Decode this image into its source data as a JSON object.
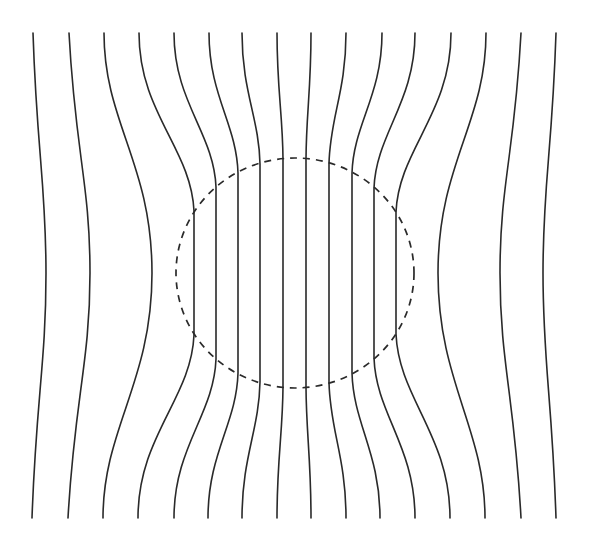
{
  "diagram": {
    "colors": {
      "background": "#ffffff",
      "line": "#2a2a2a"
    },
    "frame": {
      "top_y": 33,
      "bottom_y": 518
    },
    "boundary": {
      "shape": "circle",
      "style": "dashed",
      "cx": 295,
      "cy": 273,
      "rx": 119,
      "ry": 115
    },
    "line_count": 16,
    "lines": [
      {
        "id": 1,
        "top_x": 33,
        "bottom_x": 32,
        "mid_x": 46,
        "type": "outside"
      },
      {
        "id": 2,
        "top_x": 69,
        "bottom_x": 68,
        "mid_x": 90,
        "type": "outside"
      },
      {
        "id": 3,
        "top_x": 104,
        "bottom_x": 103,
        "mid_x": 152,
        "type": "outside"
      },
      {
        "id": 4,
        "top_x": 139,
        "bottom_x": 138,
        "inside_x": 194,
        "entry_y": 211,
        "exit_y": 335,
        "type": "inside"
      },
      {
        "id": 5,
        "top_x": 174,
        "bottom_x": 174,
        "inside_x": 216,
        "entry_y": 187,
        "exit_y": 359,
        "type": "inside"
      },
      {
        "id": 6,
        "top_x": 209,
        "bottom_x": 208,
        "inside_x": 238,
        "entry_y": 173,
        "exit_y": 373,
        "type": "inside"
      },
      {
        "id": 7,
        "top_x": 242,
        "bottom_x": 242,
        "inside_x": 260,
        "entry_y": 164,
        "exit_y": 382,
        "type": "inside"
      },
      {
        "id": 8,
        "top_x": 277,
        "bottom_x": 277,
        "inside_x": 283,
        "entry_y": 159,
        "exit_y": 387,
        "type": "inside"
      },
      {
        "id": 9,
        "top_x": 311,
        "bottom_x": 311,
        "inside_x": 306,
        "entry_y": 159,
        "exit_y": 387,
        "type": "inside"
      },
      {
        "id": 10,
        "top_x": 346,
        "bottom_x": 346,
        "inside_x": 329,
        "entry_y": 164,
        "exit_y": 382,
        "type": "inside"
      },
      {
        "id": 11,
        "top_x": 382,
        "bottom_x": 380,
        "inside_x": 352,
        "entry_y": 173,
        "exit_y": 373,
        "type": "inside"
      },
      {
        "id": 12,
        "top_x": 415,
        "bottom_x": 415,
        "inside_x": 374,
        "entry_y": 188,
        "exit_y": 358,
        "type": "inside"
      },
      {
        "id": 13,
        "top_x": 451,
        "bottom_x": 450,
        "inside_x": 396,
        "entry_y": 212,
        "exit_y": 334,
        "type": "inside"
      },
      {
        "id": 14,
        "top_x": 486,
        "bottom_x": 485,
        "mid_x": 438,
        "type": "outside"
      },
      {
        "id": 15,
        "top_x": 521,
        "bottom_x": 521,
        "mid_x": 500,
        "type": "outside"
      },
      {
        "id": 16,
        "top_x": 556,
        "bottom_x": 556,
        "mid_x": 543,
        "type": "outside"
      }
    ]
  }
}
